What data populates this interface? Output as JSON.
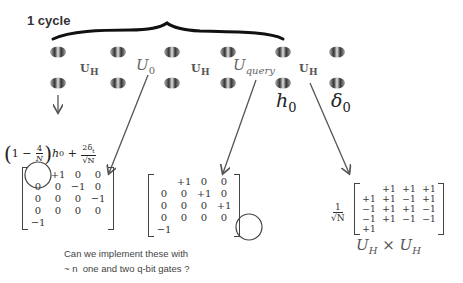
{
  "title": "1 cycle",
  "atoms": {
    "columns_x": [
      58,
      118,
      172,
      228,
      283,
      337
    ],
    "rows_y": [
      52,
      83
    ]
  },
  "gates": [
    {
      "label": "U",
      "sub": "H",
      "style": "bold",
      "x": 80,
      "y": 62
    },
    {
      "label": "U",
      "sub": "0",
      "style": "italic",
      "x": 136,
      "y": 58
    },
    {
      "label": "U",
      "sub": "H",
      "style": "bold",
      "x": 191,
      "y": 62
    },
    {
      "label": "U",
      "sub": "query",
      "style": "italic",
      "x": 233,
      "y": 58
    },
    {
      "label": "U",
      "sub": "H",
      "style": "bold",
      "x": 299,
      "y": 62
    }
  ],
  "state_labels": {
    "h0": {
      "label": "h",
      "sub": "0"
    },
    "delta0": {
      "label": "δ",
      "sub": "0"
    }
  },
  "formula": {
    "one": "1",
    "minus": "−",
    "frac1_num": "4",
    "frac1_den": "N",
    "h": "h",
    "h_sub": "0",
    "plus": "+",
    "frac2_num": "2δ",
    "frac2_num_sub": "t",
    "frac2_den": "√N"
  },
  "matrices": {
    "U0": {
      "rows": [
        [
          "+1",
          "0",
          "0",
          "0"
        ],
        [
          "0",
          "−1",
          "0",
          "0"
        ],
        [
          "0",
          "0",
          "−1",
          "0"
        ],
        [
          "0",
          "0",
          "0",
          "−1"
        ]
      ],
      "circled": "+1 (row 1, col 1)"
    },
    "Uquery": {
      "rows": [
        [
          "+1",
          "0",
          "0",
          "0"
        ],
        [
          "0",
          "+1",
          "0",
          "0"
        ],
        [
          "0",
          "0",
          "+1",
          "0"
        ],
        [
          "0",
          "0",
          "0",
          "−1"
        ]
      ],
      "circled": "−1 (row 4, col 4)"
    },
    "UH_x_UH": {
      "scale_num": "1",
      "scale_den": "√N",
      "rows": [
        [
          "+1",
          "+1",
          "+1",
          "+1"
        ],
        [
          "+1",
          "−1",
          "+1",
          "−1"
        ],
        [
          "+1",
          "+1",
          "−1",
          "−1"
        ],
        [
          "+1",
          "−1",
          "−1",
          "+1"
        ]
      ]
    }
  },
  "product_label": {
    "left": "U",
    "left_sub": "H",
    "times": "×",
    "right": "U",
    "right_sub": "H"
  },
  "question": {
    "line1": "Can we implement these with",
    "line2": "~ n  one and two q-bit gates ?"
  },
  "colors": {
    "brace": "#111111",
    "arrow": "#555555",
    "text": "#333333",
    "atom_dark": "#3a3a3a",
    "atom_light": "#bdbdbd"
  }
}
